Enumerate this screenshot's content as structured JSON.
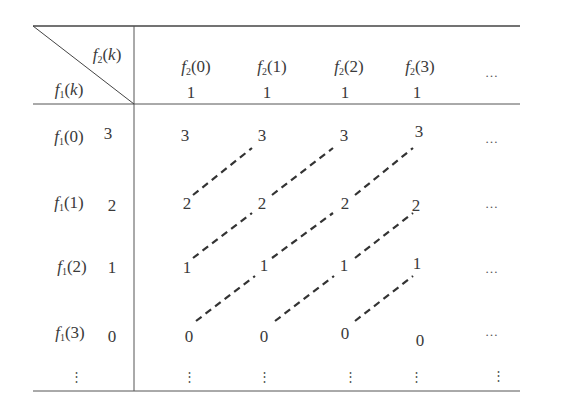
{
  "figure": {
    "type": "convolution-table",
    "row_header_label": {
      "func": "f",
      "sub": "1",
      "arg": "k"
    },
    "col_header_label": {
      "func": "f",
      "sub": "2",
      "arg": "k"
    },
    "columns": [
      {
        "func": "f",
        "sub": "2",
        "arg": "0",
        "value": "1"
      },
      {
        "func": "f",
        "sub": "2",
        "arg": "1",
        "value": "1"
      },
      {
        "func": "f",
        "sub": "2",
        "arg": "2",
        "value": "1"
      },
      {
        "func": "f",
        "sub": "2",
        "arg": "3",
        "value": "1"
      }
    ],
    "column_ellipsis": "…",
    "rows": [
      {
        "func": "f",
        "sub": "1",
        "arg": "0",
        "value": "3",
        "cells": [
          "3",
          "3",
          "3",
          "3"
        ],
        "ellipsis": "…"
      },
      {
        "func": "f",
        "sub": "1",
        "arg": "1",
        "value": "2",
        "cells": [
          "2",
          "2",
          "2",
          "2"
        ],
        "ellipsis": "…"
      },
      {
        "func": "f",
        "sub": "1",
        "arg": "2",
        "value": "1",
        "cells": [
          "1",
          "1",
          "1",
          "1"
        ],
        "ellipsis": "…"
      },
      {
        "func": "f",
        "sub": "1",
        "arg": "3",
        "value": "0",
        "cells": [
          "0",
          "0",
          "0",
          "0"
        ],
        "ellipsis": "…"
      }
    ],
    "row_ellipsis": "⋮",
    "diagonal_links": [
      {
        "from": [
          1,
          0
        ],
        "to": [
          0,
          1
        ]
      },
      {
        "from": [
          1,
          1
        ],
        "to": [
          0,
          2
        ]
      },
      {
        "from": [
          1,
          2
        ],
        "to": [
          0,
          3
        ]
      },
      {
        "from": [
          2,
          0
        ],
        "to": [
          1,
          1
        ]
      },
      {
        "from": [
          2,
          1
        ],
        "to": [
          1,
          2
        ]
      },
      {
        "from": [
          2,
          2
        ],
        "to": [
          1,
          3
        ]
      },
      {
        "from": [
          3,
          0
        ],
        "to": [
          2,
          1
        ]
      },
      {
        "from": [
          3,
          1
        ],
        "to": [
          2,
          2
        ]
      },
      {
        "from": [
          3,
          2
        ],
        "to": [
          2,
          3
        ]
      }
    ],
    "colors": {
      "ink": "#3a3a3a",
      "rule": "#444444"
    }
  }
}
